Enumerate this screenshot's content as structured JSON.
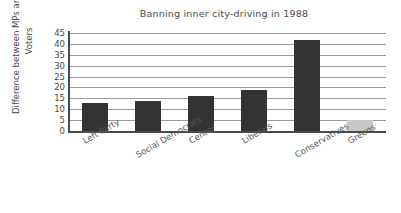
{
  "chart_data": {
    "type": "bar",
    "title": "Banning inner city-driving in 1988",
    "xlabel": "",
    "ylabel": "Difference between MPs and Party Voters",
    "ylabel_lines": [
      "Difference between MPs and Party",
      "Voters"
    ],
    "categories": [
      "Left Party",
      "Social Democrats",
      "Center",
      "Liberals",
      "Conservatives",
      "Greens"
    ],
    "values": [
      13,
      14,
      16,
      19,
      42,
      5
    ],
    "bar_colors": [
      "#333333",
      "#333333",
      "#333333",
      "#333333",
      "#333333",
      "#c8c8c8"
    ],
    "ylim": [
      0,
      45
    ],
    "ytick_step": 5,
    "yticks": [
      "0",
      "5",
      "10",
      "15",
      "20",
      "25",
      "30",
      "35",
      "40",
      "45"
    ],
    "grid": "horizontal",
    "legend": "none",
    "label_rotation_deg": -30,
    "colors": {
      "bar_dark": "#333333",
      "bar_light": "#c8c8c8",
      "gridline": "#9a9a9a",
      "axis": "#4a4a4a",
      "text": "#4a4a4a",
      "background": "#ffffff"
    }
  }
}
